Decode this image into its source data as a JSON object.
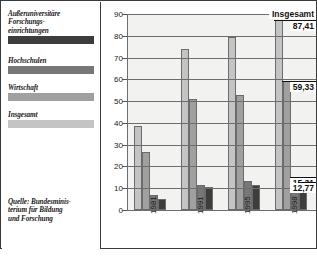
{
  "legend": {
    "items": [
      {
        "label": "Außeruniversitäre\nForschungs-\neinrichtungen",
        "label_lines": [
          "Außeruniversitäre",
          "Forschungs-",
          "einrichtungen"
        ],
        "color": "#3d3d3d"
      },
      {
        "label": "Hochschulen",
        "label_lines": [
          "Hochschulen"
        ],
        "color": "#777777"
      },
      {
        "label": "Wirtschaft",
        "label_lines": [
          "Wirtschaft"
        ],
        "color": "#a0a0a0"
      },
      {
        "label": "Insgesamt",
        "label_lines": [
          "Insgesamt"
        ],
        "color": "#c4c4c4"
      }
    ]
  },
  "source": {
    "lines": [
      "Quelle: Bundesminis-",
      "terium für Bildung",
      "und Forschung"
    ],
    "text": "Quelle: Bundesministerium für Bildung und Forschung"
  },
  "callouts": {
    "insgesamt_title": "Insgesamt",
    "insgesamt_value": "87,41",
    "wirtschaft_value": "59,33",
    "hochschulen_value": "15,31",
    "ausseruni_value": "12,77"
  },
  "chart_data": {
    "type": "bar",
    "title": "",
    "subtitle": "",
    "xlabel": "",
    "ylabel": "",
    "categories": [
      "1981",
      "1991",
      "1995",
      "1998"
    ],
    "ylim": [
      0,
      90
    ],
    "yticks": [
      0,
      10,
      20,
      30,
      40,
      50,
      60,
      70,
      80,
      90
    ],
    "grid": true,
    "legend_position": "left-panel",
    "series": [
      {
        "name": "Insgesamt",
        "color": "#c4c4c4",
        "values": [
          38.5,
          74.0,
          79.5,
          87.41
        ]
      },
      {
        "name": "Wirtschaft",
        "color": "#a0a0a0",
        "values": [
          26.5,
          51.0,
          53.0,
          59.33
        ]
      },
      {
        "name": "Hochschulen",
        "color": "#777777",
        "values": [
          7.0,
          11.5,
          13.5,
          15.31
        ]
      },
      {
        "name": "Außeruniversitäre Forschungseinrichtungen",
        "color": "#3d3d3d",
        "values": [
          5.0,
          10.5,
          11.5,
          12.77
        ]
      }
    ]
  }
}
